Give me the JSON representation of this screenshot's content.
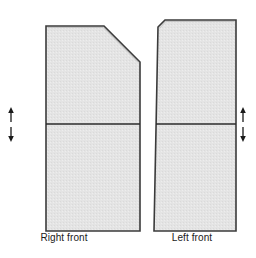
{
  "figure": {
    "background_color": "#ffffff",
    "piece_fill_color": "#e3e3e3",
    "piece_outline_color": "#3a3a3a",
    "seam_line_color": "#2b2b2b",
    "arrow_color": "#1a1a1a",
    "caption_color": "#1a1a1a"
  },
  "pieces": [
    {
      "id": "right-front",
      "label": "Right front",
      "shape": "rectangle-with-chamfered-top-right-corner",
      "outline_points": "46,26 104,26 140,62 140,231 46,231",
      "seam_line": {
        "x1": 46,
        "y1": 124,
        "x2": 140,
        "y2": 124
      },
      "markers_side": "left",
      "markers": [
        {
          "name": "grain-arrow-up",
          "direction": "up",
          "x": 11,
          "y_tip": 109,
          "y_tail": 122
        },
        {
          "name": "grain-arrow-down",
          "direction": "down",
          "x": 11,
          "y_tip": 140,
          "y_tail": 127
        }
      ]
    },
    {
      "id": "left-front",
      "label": "Left front",
      "shape": "rectangle-with-small-chamfered-top-left-corner",
      "outline_points": "158,26 164,20 236,20 236,231 154,231",
      "seam_line": {
        "x1": 156,
        "y1": 124,
        "x2": 236,
        "y2": 124
      },
      "markers_side": "right",
      "markers": [
        {
          "name": "grain-arrow-up",
          "direction": "up",
          "x": 243,
          "y_tip": 109,
          "y_tail": 122
        },
        {
          "name": "grain-arrow-down",
          "direction": "down",
          "x": 243,
          "y_tip": 140,
          "y_tail": 127
        }
      ]
    }
  ],
  "captions": {
    "right_front": "Right front",
    "left_front": "Left front"
  }
}
